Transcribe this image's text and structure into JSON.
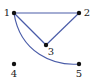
{
  "diagram": {
    "type": "undirected-graph",
    "edge_color": "#4a5ca8",
    "node_color": "#111111",
    "nodes": [
      {
        "id": "1",
        "label": "1",
        "x": 14,
        "y": 13,
        "lx": 7,
        "ly": 16,
        "anchor": "middle"
      },
      {
        "id": "2",
        "label": "2",
        "x": 79,
        "y": 13,
        "lx": 87,
        "ly": 16,
        "anchor": "middle"
      },
      {
        "id": "3",
        "label": "3",
        "x": 46,
        "y": 45,
        "lx": 51,
        "ly": 55,
        "anchor": "middle"
      },
      {
        "id": "4",
        "label": "4",
        "x": 14,
        "y": 64,
        "lx": 14,
        "ly": 77,
        "anchor": "middle"
      },
      {
        "id": "5",
        "label": "5",
        "x": 79,
        "y": 64,
        "lx": 79,
        "ly": 77,
        "anchor": "middle"
      }
    ],
    "edges": [
      {
        "from": "1",
        "to": "2",
        "curved": false
      },
      {
        "from": "2",
        "to": "3",
        "curved": false
      },
      {
        "from": "1",
        "to": "3",
        "curved": false
      },
      {
        "from": "1",
        "to": "5",
        "curved": true
      }
    ]
  }
}
